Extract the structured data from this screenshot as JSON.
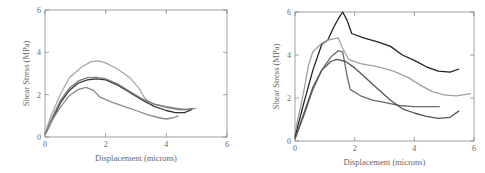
{
  "chart_data": [
    {
      "type": "line",
      "title": "",
      "xlabel": "Displacement (microns)",
      "ylabel": "Shear Stress (MPa)",
      "xlim": [
        0,
        6
      ],
      "ylim": [
        0,
        6
      ],
      "xticks": [
        "0",
        "2",
        "4",
        "6"
      ],
      "yticks": [
        "0",
        "2",
        "4",
        "6"
      ],
      "grid": false,
      "legend": null,
      "series": [
        {
          "name": "curve-1 (light gray, highest)",
          "color": "#a8a8a8",
          "points": [
            [
              0,
              0.2
            ],
            [
              0.2,
              1.0
            ],
            [
              0.5,
              2.0
            ],
            [
              0.8,
              2.8
            ],
            [
              1.2,
              3.3
            ],
            [
              1.5,
              3.55
            ],
            [
              1.75,
              3.6
            ],
            [
              2.0,
              3.5
            ],
            [
              2.4,
              3.2
            ],
            [
              2.8,
              2.8
            ],
            [
              3.1,
              2.3
            ],
            [
              3.3,
              1.8
            ],
            [
              3.6,
              1.55
            ],
            [
              4.0,
              1.45
            ],
            [
              4.4,
              1.35
            ],
            [
              4.6,
              1.3
            ],
            [
              5.0,
              1.35
            ]
          ]
        },
        {
          "name": "curve-2 (dark)",
          "color": "#333333",
          "points": [
            [
              0,
              0.1
            ],
            [
              0.2,
              0.7
            ],
            [
              0.5,
              1.6
            ],
            [
              0.8,
              2.2
            ],
            [
              1.1,
              2.55
            ],
            [
              1.4,
              2.7
            ],
            [
              1.7,
              2.75
            ],
            [
              2.0,
              2.7
            ],
            [
              2.4,
              2.45
            ],
            [
              2.8,
              2.1
            ],
            [
              3.2,
              1.75
            ],
            [
              3.6,
              1.45
            ],
            [
              4.0,
              1.25
            ],
            [
              4.3,
              1.15
            ],
            [
              4.6,
              1.15
            ],
            [
              4.85,
              1.3
            ]
          ]
        },
        {
          "name": "curve-3 (medium gray)",
          "color": "#7a7a7a",
          "points": [
            [
              0,
              0.1
            ],
            [
              0.2,
              0.8
            ],
            [
              0.5,
              1.7
            ],
            [
              0.8,
              2.3
            ],
            [
              1.1,
              2.65
            ],
            [
              1.4,
              2.8
            ],
            [
              1.7,
              2.82
            ],
            [
              2.0,
              2.75
            ],
            [
              2.4,
              2.5
            ],
            [
              2.8,
              2.15
            ],
            [
              3.2,
              1.8
            ],
            [
              3.6,
              1.55
            ],
            [
              4.0,
              1.4
            ],
            [
              4.4,
              1.3
            ],
            [
              4.7,
              1.3
            ],
            [
              4.9,
              1.35
            ]
          ]
        },
        {
          "name": "curve-4 (gray, lowest)",
          "color": "#8a8a8a",
          "points": [
            [
              0,
              0.1
            ],
            [
              0.2,
              0.7
            ],
            [
              0.5,
              1.4
            ],
            [
              0.8,
              1.95
            ],
            [
              1.1,
              2.25
            ],
            [
              1.35,
              2.35
            ],
            [
              1.6,
              2.2
            ],
            [
              1.8,
              1.9
            ],
            [
              2.2,
              1.65
            ],
            [
              2.6,
              1.45
            ],
            [
              3.0,
              1.25
            ],
            [
              3.4,
              1.05
            ],
            [
              3.8,
              0.9
            ],
            [
              4.0,
              0.85
            ],
            [
              4.2,
              0.9
            ],
            [
              4.4,
              1.0
            ]
          ]
        }
      ]
    },
    {
      "type": "line",
      "title": "",
      "xlabel": "Displacement (microns)",
      "ylabel": "Shear Stress (MPa)",
      "xlim": [
        0,
        6
      ],
      "ylim": [
        0,
        6
      ],
      "xticks": [
        "0",
        "2",
        "4",
        "6"
      ],
      "yticks": [
        "0",
        "2",
        "4",
        "6"
      ],
      "grid": false,
      "legend": null,
      "series": [
        {
          "name": "curve-1 (black, peak 6)",
          "color": "#222222",
          "points": [
            [
              0,
              0.2
            ],
            [
              0.3,
              1.8
            ],
            [
              0.6,
              3.3
            ],
            [
              0.9,
              4.5
            ],
            [
              1.1,
              4.7
            ],
            [
              1.3,
              5.3
            ],
            [
              1.5,
              5.8
            ],
            [
              1.6,
              6.0
            ],
            [
              1.75,
              5.6
            ],
            [
              1.9,
              5.0
            ],
            [
              2.3,
              4.8
            ],
            [
              2.8,
              4.6
            ],
            [
              3.2,
              4.4
            ],
            [
              3.6,
              4.0
            ],
            [
              4.0,
              3.75
            ],
            [
              4.4,
              3.45
            ],
            [
              4.8,
              3.25
            ],
            [
              5.2,
              3.2
            ],
            [
              5.5,
              3.35
            ]
          ]
        },
        {
          "name": "curve-2 (light gray)",
          "color": "#a0a0a0",
          "points": [
            [
              0,
              0.4
            ],
            [
              0.25,
              2.0
            ],
            [
              0.45,
              3.5
            ],
            [
              0.6,
              4.15
            ],
            [
              0.9,
              4.55
            ],
            [
              1.1,
              4.7
            ],
            [
              1.3,
              4.75
            ],
            [
              1.45,
              4.8
            ],
            [
              1.6,
              4.3
            ],
            [
              1.8,
              3.8
            ],
            [
              2.2,
              3.6
            ],
            [
              2.8,
              3.45
            ],
            [
              3.3,
              3.25
            ],
            [
              3.8,
              2.95
            ],
            [
              4.2,
              2.6
            ],
            [
              4.6,
              2.3
            ],
            [
              5.0,
              2.15
            ],
            [
              5.4,
              2.1
            ],
            [
              5.9,
              2.2
            ]
          ]
        },
        {
          "name": "curve-3 (medium gray, sharp drop)",
          "color": "#6a6a6a",
          "points": [
            [
              0,
              0.1
            ],
            [
              0.3,
              1.2
            ],
            [
              0.6,
              2.4
            ],
            [
              0.9,
              3.3
            ],
            [
              1.2,
              3.9
            ],
            [
              1.45,
              4.2
            ],
            [
              1.6,
              4.15
            ],
            [
              1.75,
              3.0
            ],
            [
              1.85,
              2.4
            ],
            [
              2.2,
              2.1
            ],
            [
              2.6,
              1.9
            ],
            [
              3.0,
              1.8
            ],
            [
              3.5,
              1.65
            ],
            [
              4.0,
              1.6
            ],
            [
              4.5,
              1.6
            ],
            [
              4.85,
              1.6
            ]
          ]
        },
        {
          "name": "curve-4 (dark gray)",
          "color": "#555555",
          "points": [
            [
              0,
              0.1
            ],
            [
              0.3,
              1.3
            ],
            [
              0.6,
              2.5
            ],
            [
              0.9,
              3.3
            ],
            [
              1.2,
              3.7
            ],
            [
              1.4,
              3.8
            ],
            [
              1.7,
              3.7
            ],
            [
              2.0,
              3.4
            ],
            [
              2.4,
              2.9
            ],
            [
              2.8,
              2.4
            ],
            [
              3.2,
              1.9
            ],
            [
              3.6,
              1.5
            ],
            [
              4.0,
              1.3
            ],
            [
              4.4,
              1.15
            ],
            [
              4.8,
              1.05
            ],
            [
              5.2,
              1.1
            ],
            [
              5.5,
              1.4
            ]
          ]
        }
      ]
    }
  ]
}
